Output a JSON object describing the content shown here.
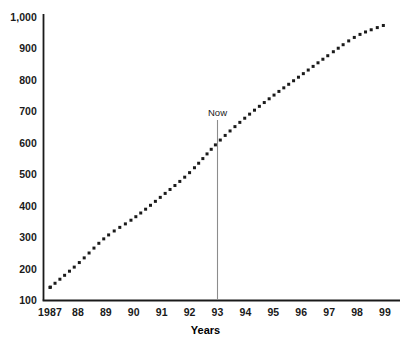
{
  "chart_data": {
    "type": "line",
    "title": "",
    "xlabel": "Years",
    "ylabel": "",
    "grid": false,
    "legend": false,
    "line_style": "dotted",
    "marker": "square-dot",
    "xlim": [
      1987,
      1999.5
    ],
    "ylim": [
      100,
      1000
    ],
    "x_tick_labels": [
      "1987",
      "88",
      "89",
      "90",
      "91",
      "92",
      "93",
      "94",
      "95",
      "96",
      "97",
      "98",
      "99"
    ],
    "x": [
      1987,
      1988,
      1989,
      1990,
      1991,
      1992,
      1993,
      1994,
      1995,
      1996,
      1997,
      1998,
      1999
    ],
    "y_tick_labels": [
      "1,000",
      "900",
      "800",
      "700",
      "600",
      "500",
      "400",
      "300",
      "200",
      "100"
    ],
    "y_ticks": [
      1000,
      900,
      800,
      700,
      600,
      500,
      400,
      300,
      200,
      100
    ],
    "values": [
      140,
      215,
      300,
      360,
      430,
      505,
      600,
      680,
      750,
      815,
      880,
      940,
      975
    ],
    "annotations": [
      {
        "label": "Now",
        "x": 1993,
        "y_value": 600,
        "type": "vertical-marker-line"
      }
    ],
    "colors": {
      "axis": "#1a1a1a",
      "series": "#1a1a1a",
      "annotation_line": "#8c8c8c",
      "background": "#ffffff"
    }
  },
  "partial_top_text": ""
}
